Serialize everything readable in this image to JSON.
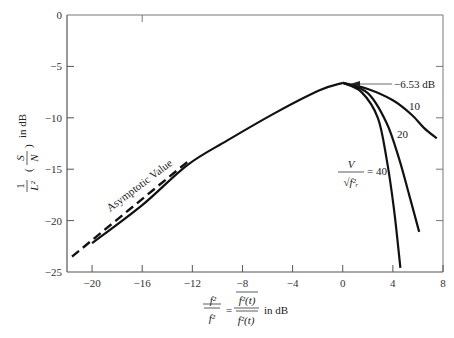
{
  "chart_data": {
    "type": "line",
    "title": "",
    "xlabel": "f̄²/f̄r² = f²(t)/fr²(t) in dB",
    "ylabel": "(1/L²)(So/Nq) in dB",
    "xlim": [
      -22,
      8
    ],
    "ylim": [
      -25,
      0
    ],
    "x_ticks": [
      -20,
      -16,
      -12,
      -8,
      -4,
      0,
      4,
      8
    ],
    "y_ticks": [
      0,
      -5,
      -10,
      -15,
      -20,
      -25
    ],
    "grid": false,
    "legend": "none (inline labels)",
    "series": [
      {
        "name": "main curve (common)",
        "style": "solid",
        "x": [
          -20,
          -16,
          -12.4,
          -9.2,
          -5.2,
          -1.8,
          0
        ],
        "y": [
          -22.2,
          -18.5,
          -14.6,
          -12.2,
          -9.4,
          -7.3,
          -6.6
        ]
      },
      {
        "name": "V/sqrt(fr²) = 10",
        "style": "solid",
        "x": [
          0,
          2,
          4,
          5.5,
          6.5,
          7.5
        ],
        "y": [
          -6.6,
          -7.2,
          -8.3,
          -9.7,
          -11.0,
          -12.0
        ]
      },
      {
        "name": "V/sqrt(fr²) = 20",
        "style": "solid",
        "x": [
          0,
          2,
          3.5,
          4.5,
          5.3,
          6.1
        ],
        "y": [
          -6.6,
          -7.6,
          -10.5,
          -14.0,
          -17.5,
          -21.1
        ]
      },
      {
        "name": "V/sqrt(fr²) = 40",
        "style": "solid",
        "x": [
          0,
          1.5,
          2.8,
          3.5,
          4.1,
          4.6
        ],
        "y": [
          -6.6,
          -7.5,
          -10.0,
          -14.0,
          -19.0,
          -24.6
        ]
      },
      {
        "name": "Asymptotic Value",
        "style": "dashed",
        "x": [
          -21.6,
          -12.4
        ],
        "y": [
          -23.5,
          -14.3
        ]
      }
    ],
    "annotations": [
      {
        "text": "-6.53 dB",
        "x": 0,
        "y": -6.53,
        "arrow": true
      },
      {
        "text": "10",
        "series": "V/sqrt(fr²) = 10"
      },
      {
        "text": "20",
        "series": "V/sqrt(fr²) = 20"
      },
      {
        "text": "V/sqrt(fr²) = 40",
        "series": "V/sqrt(fr²) = 40"
      },
      {
        "text": "Asymptotic Value",
        "series": "Asymptotic Value"
      }
    ]
  },
  "labels": {
    "peak": "−6.53 dB",
    "v10": "10",
    "v20": "20",
    "v40_eq": "= 40",
    "v_num": "V",
    "v_den": "√f²ᵣ",
    "asymptotic": "Asymptotic Value",
    "ylabel_frac_num": "1",
    "ylabel_frac_den": "L²",
    "ylabel_so": "S",
    "ylabel_nq": "N",
    "ylabel_unit": "in dB",
    "xlabel_lhs_num": "f²",
    "xlabel_lhs_den": "f²",
    "xlabel_eq": "=",
    "xlabel_rhs_num": "f²(t)",
    "xlabel_rhs_den": "f²(t)",
    "xlabel_unit": "in dB"
  }
}
